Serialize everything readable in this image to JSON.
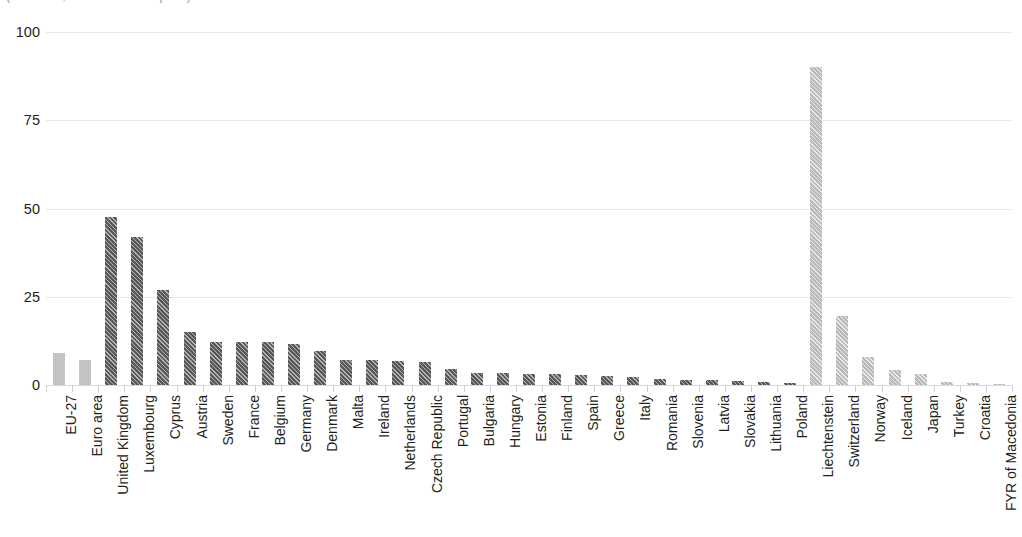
{
  "chart_title": "(% of total, all sizes of enterprise)",
  "chart_data": {
    "type": "bar",
    "title": "(% of total, all sizes of enterprise)",
    "xlabel": "",
    "ylabel": "",
    "ylim": [
      0,
      100
    ],
    "yticks": [
      0,
      25,
      50,
      75,
      100
    ],
    "ytick_labels": [
      "0",
      "25",
      "50",
      "75",
      "100"
    ],
    "grid": true,
    "legend": "none",
    "orientation": "vertical",
    "categories": [
      "EU-27",
      "Euro area",
      "United Kingdom",
      "Luxembourg",
      "Cyprus",
      "Austria",
      "Sweden",
      "France",
      "Belgium",
      "Germany",
      "Denmark",
      "Malta",
      "Ireland",
      "Netherlands",
      "Czech Republic",
      "Portugal",
      "Bulgaria",
      "Hungary",
      "Estonia",
      "Finland",
      "Spain",
      "Greece",
      "Italy",
      "Romania",
      "Slovenia",
      "Latvia",
      "Slovakia",
      "Lithuania",
      "Poland",
      "Liechtenstein",
      "Switzerland",
      "Norway",
      "Iceland",
      "Japan",
      "Turkey",
      "Croatia",
      "FYR of Macedonia"
    ],
    "values": [
      9.0,
      7.0,
      47.5,
      42.0,
      27.0,
      15.0,
      12.2,
      12.2,
      12.2,
      11.5,
      9.5,
      7.0,
      7.0,
      6.8,
      6.5,
      4.5,
      3.5,
      3.3,
      3.2,
      3.0,
      2.8,
      2.5,
      2.3,
      1.8,
      1.5,
      1.3,
      1.2,
      0.8,
      0.6,
      90.0,
      19.5,
      8.0,
      4.2,
      3.0,
      0.8,
      0.6,
      0.4
    ],
    "bar_styles": [
      "solid-light",
      "solid-light",
      "hatch-dark",
      "hatch-dark",
      "hatch-dark",
      "hatch-dark",
      "hatch-dark",
      "hatch-dark",
      "hatch-dark",
      "hatch-dark",
      "hatch-dark",
      "hatch-dark",
      "hatch-dark",
      "hatch-dark",
      "hatch-dark",
      "hatch-dark",
      "hatch-dark",
      "hatch-dark",
      "hatch-dark",
      "hatch-dark",
      "hatch-dark",
      "hatch-dark",
      "hatch-dark",
      "hatch-dark",
      "hatch-dark",
      "hatch-dark",
      "hatch-dark",
      "hatch-dark",
      "hatch-dark",
      "hatch-light",
      "hatch-light",
      "hatch-light",
      "hatch-light",
      "hatch-light",
      "hatch-light",
      "hatch-light",
      "hatch-light"
    ]
  },
  "colors": {
    "bar_dark": "#57585a",
    "bar_light": "#b9b9b9",
    "bar_solid_light": "#c4c4c4",
    "gridline": "#e8e8e8",
    "axis": "#d9d9d9",
    "text": "#231f20",
    "background": "#ffffff"
  }
}
